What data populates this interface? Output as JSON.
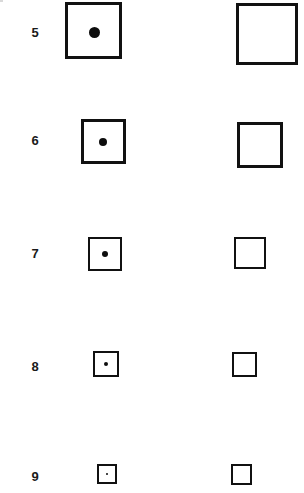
{
  "figure": {
    "type": "diagram",
    "canvas": {
      "width": 304,
      "height": 493,
      "background": "#ffffff"
    },
    "ink_color": "#111111",
    "dot_color": "#0d0d0d",
    "label_color": "#1a1a1a",
    "columns": [
      {
        "key": "left",
        "name": "square-with-dot"
      },
      {
        "key": "right",
        "name": "empty-square"
      }
    ],
    "rows": [
      {
        "label": "5",
        "label_x": 35,
        "label_y": 33,
        "label_size": 13,
        "left": {
          "x": 65,
          "y": 2,
          "size": 57,
          "border": 3
        },
        "right": {
          "x": 236,
          "y": 3,
          "size": 62,
          "border": 3
        },
        "dot": {
          "cx": 94,
          "cy": 32,
          "d": 11
        }
      },
      {
        "label": "6",
        "label_x": 35,
        "label_y": 141,
        "label_size": 13,
        "left": {
          "x": 81,
          "y": 119,
          "size": 45,
          "border": 3
        },
        "right": {
          "x": 237,
          "y": 122,
          "size": 46,
          "border": 3
        },
        "dot": {
          "cx": 103,
          "cy": 142,
          "d": 8
        }
      },
      {
        "label": "7",
        "label_x": 35,
        "label_y": 254,
        "label_size": 13,
        "left": {
          "x": 88,
          "y": 237,
          "size": 34,
          "border": 2.5
        },
        "right": {
          "x": 234,
          "y": 237,
          "size": 32,
          "border": 2.5
        },
        "dot": {
          "cx": 105,
          "cy": 254,
          "d": 6
        }
      },
      {
        "label": "8",
        "label_x": 35,
        "label_y": 367,
        "label_size": 13,
        "left": {
          "x": 93,
          "y": 351,
          "size": 26,
          "border": 2.5
        },
        "right": {
          "x": 232,
          "y": 352,
          "size": 25,
          "border": 2.5
        },
        "dot": {
          "cx": 106,
          "cy": 364,
          "d": 4
        }
      },
      {
        "label": "9",
        "label_x": 35,
        "label_y": 477,
        "label_size": 13,
        "left": {
          "x": 97,
          "y": 464,
          "size": 20,
          "border": 2
        },
        "right": {
          "x": 231,
          "y": 464,
          "size": 21,
          "border": 2
        },
        "dot": {
          "cx": 107,
          "cy": 474,
          "d": 2.5
        }
      }
    ],
    "artifacts": [
      {
        "x": 0,
        "y": 0,
        "w": 3,
        "h": 2
      }
    ]
  }
}
